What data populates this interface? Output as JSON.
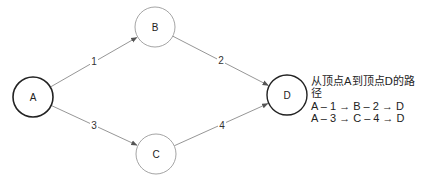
{
  "diagram": {
    "type": "directed-graph",
    "nodes": [
      {
        "id": "A",
        "label": "A",
        "cx": 33,
        "cy": 97,
        "r": 20,
        "stroke": "#222222",
        "stroke_width": 1.6
      },
      {
        "id": "B",
        "label": "B",
        "cx": 155,
        "cy": 27,
        "r": 20,
        "stroke": "#9a9a9a",
        "stroke_width": 0.9
      },
      {
        "id": "C",
        "label": "C",
        "cx": 156,
        "cy": 154,
        "r": 20,
        "stroke": "#9a9a9a",
        "stroke_width": 0.9
      },
      {
        "id": "D",
        "label": "D",
        "cx": 287,
        "cy": 95,
        "r": 20,
        "stroke": "#222222",
        "stroke_width": 1.4
      }
    ],
    "edges": [
      {
        "from": "A",
        "to": "B",
        "label": "1",
        "label_x": 94,
        "label_y": 61
      },
      {
        "from": "A",
        "to": "C",
        "label": "3",
        "label_x": 94,
        "label_y": 125
      },
      {
        "from": "B",
        "to": "D",
        "label": "2",
        "label_x": 221,
        "label_y": 60
      },
      {
        "from": "C",
        "to": "D",
        "label": "4",
        "label_x": 222,
        "label_y": 125
      }
    ]
  },
  "legend": {
    "title": "从顶点A到顶点D的路径",
    "paths": [
      "A – 1 → B – 2 → D",
      "A – 3 → C – 4 → D"
    ]
  }
}
